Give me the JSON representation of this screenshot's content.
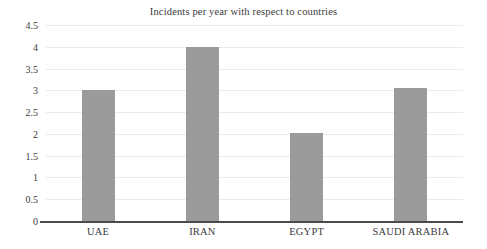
{
  "chart_data": {
    "type": "bar",
    "title": "Incidents per year with respect to countries",
    "xlabel": "",
    "ylabel": "",
    "categories": [
      "UAE",
      "IRAN",
      "EGYPT",
      "SAUDI ARABIA"
    ],
    "values": [
      3,
      4,
      2.03,
      3.05
    ],
    "ylim": [
      0,
      4.5
    ],
    "yticks": [
      "0",
      "0.5",
      "1",
      "1.5",
      "2",
      "2.5",
      "3",
      "3.5",
      "4",
      "4.5"
    ],
    "ytick_values": [
      0,
      0.5,
      1,
      1.5,
      2,
      2.5,
      3,
      3.5,
      4,
      4.5
    ],
    "grid": true,
    "legend": false,
    "series": [
      {
        "name": "Incidents per year",
        "values": [
          3,
          4,
          2.03,
          3.05
        ]
      }
    ],
    "colors": {
      "bar_fill": "#9b9b9b",
      "gridline": "#ebebeb",
      "axis_line": "#4a4a4a",
      "text": "#3b3b3b",
      "background": "#ffffff"
    }
  }
}
